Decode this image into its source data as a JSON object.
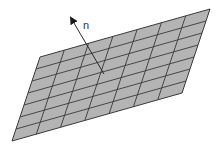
{
  "diagram": {
    "type": "surface-normal",
    "plane": {
      "corners": {
        "top_left": [
          40,
          57
        ],
        "top_right": [
          210,
          9
        ],
        "bottom_right": [
          182,
          93
        ],
        "bottom_left": [
          12,
          141
        ]
      },
      "columns": 7,
      "rows": 7,
      "fill_color": "#b4b4b4",
      "line_color": "#3a3a3a"
    },
    "normal_vector": {
      "label": "n",
      "base": [
        104,
        74
      ],
      "tip": [
        71,
        18
      ],
      "label_position": [
        83,
        29
      ],
      "color": "#2a2a2a"
    }
  }
}
